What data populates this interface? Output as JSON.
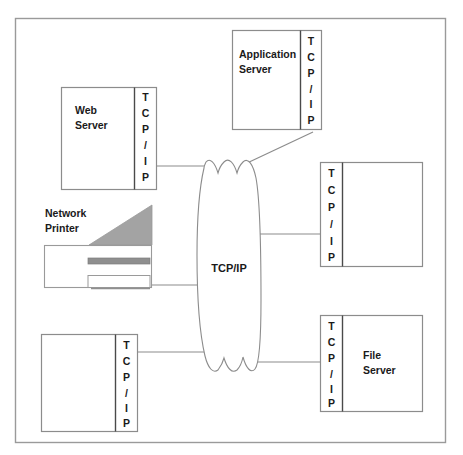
{
  "diagram": {
    "border": {
      "stroke": "#9a9a9a"
    },
    "cloud": {
      "label": "TCP/IP",
      "stroke": "#8c8c8c",
      "fill": "#ffffff"
    },
    "stack_letters": [
      "T",
      "C",
      "P",
      "/",
      "I",
      "P"
    ],
    "colors": {
      "box_stroke": "#8c8c8c",
      "strip_stroke": "#4a4a4a",
      "box_fill": "#ffffff",
      "text": "#1a1a1a",
      "line": "#8c8c8c",
      "printer_gray": "#a3a3a3",
      "printer_bar": "#8f8f8f"
    },
    "nodes": [
      {
        "id": "web-server",
        "label_lines": [
          "Web",
          "Server"
        ],
        "stack_side": "right",
        "x": 61,
        "y": 87,
        "w": 96,
        "h": 103,
        "strip_w": 22
      },
      {
        "id": "application-server",
        "label_lines": [
          "Application",
          "Server"
        ],
        "stack_side": "right",
        "x": 232,
        "y": 30,
        "w": 90,
        "h": 100,
        "strip_w": 22
      },
      {
        "id": "right-middle-server",
        "label_lines": [],
        "stack_side": "left",
        "x": 320,
        "y": 162,
        "w": 103,
        "h": 105,
        "strip_w": 22
      },
      {
        "id": "file-server",
        "label_lines": [
          "File",
          "Server"
        ],
        "stack_side": "left",
        "x": 320,
        "y": 315,
        "w": 103,
        "h": 97,
        "strip_w": 22
      },
      {
        "id": "bottom-left-server",
        "label_lines": [],
        "stack_side": "right",
        "x": 41,
        "y": 334,
        "w": 97,
        "h": 98,
        "strip_w": 22
      }
    ],
    "printer": {
      "id": "network-printer",
      "label_lines": [
        "Network",
        "Printer"
      ],
      "label_x": 45,
      "label_y": 217,
      "body": {
        "x": 44,
        "y": 245,
        "w": 108,
        "h": 43
      },
      "bar": {
        "x": 88,
        "y": 258,
        "w": 62,
        "h": 6
      },
      "tray": {
        "x": 88,
        "y": 276,
        "w": 62,
        "h": 12
      }
    },
    "links": [
      {
        "id": "link-web-to-cloud",
        "from": "web-server",
        "to": "cloud"
      },
      {
        "id": "link-app-to-cloud",
        "from": "application-server",
        "to": "cloud"
      },
      {
        "id": "link-printer-to-cloud",
        "from": "network-printer",
        "to": "cloud"
      },
      {
        "id": "link-cloud-to-right-middle",
        "from": "cloud",
        "to": "right-middle-server"
      },
      {
        "id": "link-bottomleft-to-cloud",
        "from": "bottom-left-server",
        "to": "cloud"
      },
      {
        "id": "link-cloud-to-file",
        "from": "cloud",
        "to": "file-server"
      }
    ]
  }
}
